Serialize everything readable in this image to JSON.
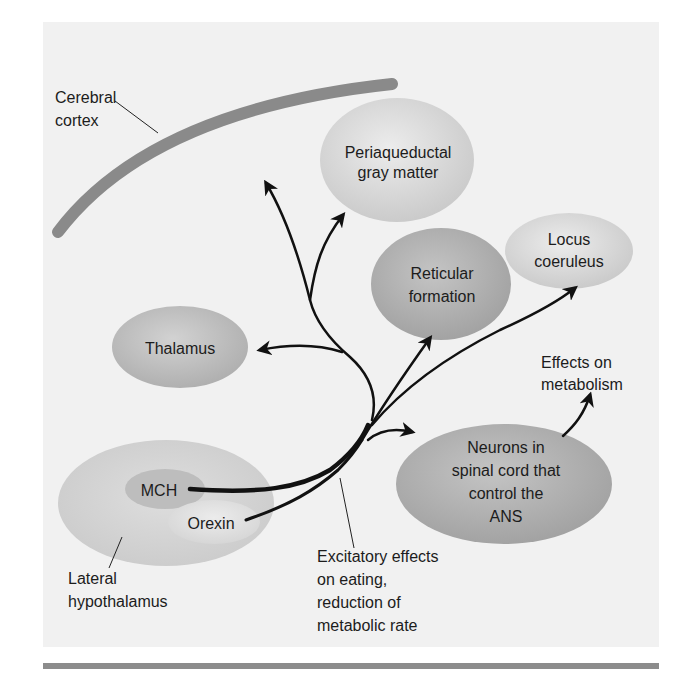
{
  "figure": {
    "colors": {
      "panel": "#f1f1f1",
      "cortex_band": "#8a8a8a",
      "arrow": "#111111",
      "bottom_rule": "#8c8c8c",
      "node_light": "#d4d4d4",
      "node_mid": "#b9b9b9",
      "node_dark": "#a9a9a9"
    }
  },
  "labels": {
    "cerebral_cortex": [
      "Cerebral",
      "cortex"
    ],
    "periaqueductal": [
      "Periaqueductal",
      "gray matter"
    ],
    "locus_coeruleus": [
      "Locus",
      "coeruleus"
    ],
    "reticular_formation": [
      "Reticular",
      "formation"
    ],
    "thalamus": [
      "Thalamus"
    ],
    "effects_metabolism": [
      "Effects on",
      "metabolism"
    ],
    "spinal_neurons": [
      "Neurons in",
      "spinal cord that",
      "control the",
      "ANS"
    ],
    "mch": [
      "MCH"
    ],
    "orexin": [
      "Orexin"
    ],
    "lateral_hypothalamus": [
      "Lateral",
      "hypothalamus"
    ],
    "excitatory_effects": [
      "Excitatory effects",
      "on eating,",
      "reduction of",
      "metabolic rate"
    ]
  }
}
